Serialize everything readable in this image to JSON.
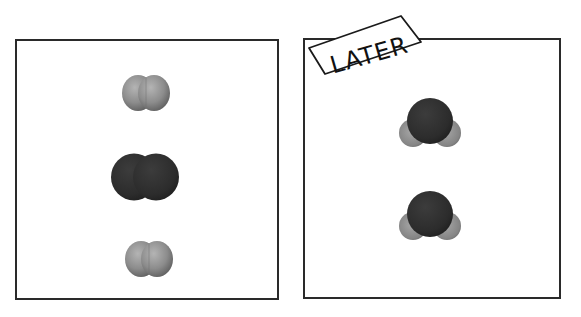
{
  "panels": [
    {
      "id": "before",
      "label": "",
      "molecules": [
        {
          "type": "diatomic",
          "shade": "light-gray",
          "cx": 146,
          "cy": 93
        },
        {
          "type": "diatomic",
          "shade": "dark",
          "cx": 145,
          "cy": 177
        },
        {
          "type": "diatomic",
          "shade": "light-gray",
          "cx": 149,
          "cy": 259
        }
      ]
    },
    {
      "id": "after",
      "label": "LATER",
      "molecules": [
        {
          "type": "triatomic-bent",
          "cx": 430,
          "cy": 122
        },
        {
          "type": "triatomic-bent",
          "cx": 430,
          "cy": 215
        }
      ]
    }
  ],
  "colors": {
    "border": "#2a2a2a",
    "light_atom": "#8a8a8a",
    "dark_atom": "#2e2e2e"
  }
}
